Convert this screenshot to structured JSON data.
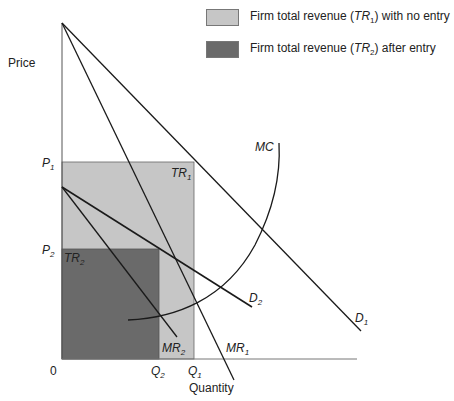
{
  "legend": [
    {
      "prefix": "Firm total revenue (",
      "sym": "TR",
      "sub": "1",
      "suffix": ") with no entry",
      "color": "#c6c6c6"
    },
    {
      "prefix": "Firm total revenue (",
      "sym": "TR",
      "sub": "2",
      "suffix": ") after entry",
      "color": "#6a6a6a"
    }
  ],
  "axes": {
    "y_label": "Price",
    "x_label": "Quantity",
    "origin_label": "0"
  },
  "ticks": {
    "p1": {
      "sym": "P",
      "sub": "1"
    },
    "p2": {
      "sym": "P",
      "sub": "2"
    },
    "q1": {
      "sym": "Q",
      "sub": "1"
    },
    "q2": {
      "sym": "Q",
      "sub": "2"
    }
  },
  "curves": {
    "d1": {
      "sym": "D",
      "sub": "1"
    },
    "d2": {
      "sym": "D",
      "sub": "2"
    },
    "mr1": {
      "sym": "MR",
      "sub": "1"
    },
    "mr2": {
      "sym": "MR",
      "sub": "2"
    },
    "mc": {
      "sym": "MC",
      "sub": ""
    }
  },
  "areas": {
    "tr1": {
      "sym": "TR",
      "sub": "1"
    },
    "tr2": {
      "sym": "TR",
      "sub": "2"
    }
  },
  "colors": {
    "tr1_fill": "#c6c6c6",
    "tr2_fill": "#6a6a6a",
    "line": "#1a1a1a"
  }
}
